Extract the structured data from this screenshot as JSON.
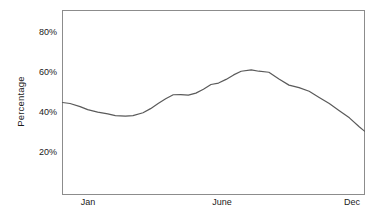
{
  "chart_data": {
    "type": "line",
    "title": "",
    "xlabel": "",
    "ylabel": "Percentage",
    "ylim": [
      0,
      90
    ],
    "xlim": [
      0,
      12
    ],
    "grid": false,
    "legend": false,
    "y_ticks": [
      {
        "label": "80%",
        "value": 80
      },
      {
        "label": "60%",
        "value": 60
      },
      {
        "label": "40%",
        "value": 40
      },
      {
        "label": "20%",
        "value": 20
      }
    ],
    "x_ticks": [
      {
        "label": "Jan",
        "value": 0.7
      },
      {
        "label": "June",
        "value": 5.8
      },
      {
        "label": "Dec",
        "value": 11.5
      }
    ],
    "series": [
      {
        "name": "percentage",
        "color": "#5a5a5a",
        "x": [
          0.0,
          0.3,
          0.7,
          1.0,
          1.4,
          1.8,
          2.1,
          2.5,
          2.8,
          3.2,
          3.5,
          3.8,
          4.1,
          4.4,
          4.7,
          5.0,
          5.3,
          5.6,
          5.9,
          6.2,
          6.5,
          6.8,
          7.1,
          7.5,
          7.8,
          8.2,
          8.6,
          9.0,
          9.4,
          9.8,
          10.2,
          10.6,
          11.0,
          11.4,
          11.8,
          12.0
        ],
        "values": [
          45.0,
          44.5,
          43.0,
          41.5,
          40.3,
          39.4,
          38.6,
          38.3,
          38.6,
          40.0,
          42.0,
          44.5,
          46.8,
          48.8,
          48.9,
          48.6,
          49.6,
          51.5,
          53.8,
          54.5,
          56.3,
          58.5,
          60.3,
          61.0,
          60.3,
          59.8,
          56.5,
          53.5,
          52.3,
          50.5,
          47.5,
          44.5,
          41.0,
          37.5,
          33.0,
          31.0
        ]
      }
    ],
    "notes": {
      "start_value": "45%",
      "minimum": "38% around late February",
      "peak": "61% around early July",
      "end_value": "17%"
    }
  },
  "axis": {
    "y_title": "Percentage"
  }
}
